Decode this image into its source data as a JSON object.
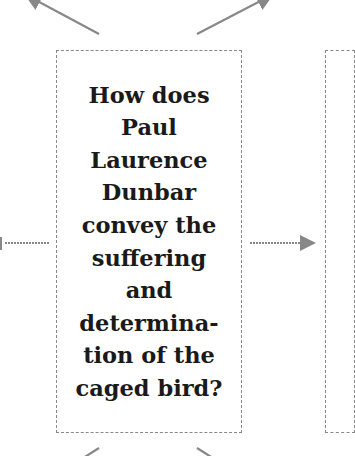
{
  "diagram": {
    "central_question": {
      "lines": [
        "How does",
        "Paul",
        "Laurence",
        "Dunbar",
        "convey the",
        "suffering",
        "and",
        "determina-",
        "tion of the",
        "caged bird?"
      ],
      "full_text": "How does Paul Laurence Dunbar convey the suffering and determination of the caged bird?"
    },
    "colors": {
      "arrow": "#888888",
      "border": "#888888",
      "text": "#1a1a1a"
    }
  }
}
